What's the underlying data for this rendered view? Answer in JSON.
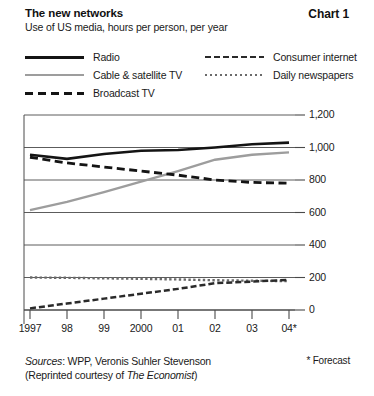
{
  "header": {
    "title": "The new networks",
    "subtitle": "Use of US media, hours per person, per year",
    "chart_number": "Chart 1"
  },
  "footer": {
    "sources_prefix": "Sources",
    "sources_text": ": WPP, Veronis Suhler Stevenson",
    "reprint_pre": "(Reprinted courtesy of ",
    "reprint_em": "The Economist",
    "reprint_post": ")",
    "forecast_note": "* Forecast"
  },
  "colors": {
    "radio": "#141414",
    "cable": "#9d9d9d",
    "broadcast": "#141414",
    "internet": "#2a2a2a",
    "newspapers": "#6a6a6a",
    "axis": "#4a4a4a",
    "grid": "#4a4a4a",
    "background": "#ffffff",
    "text": "#1a1a1a"
  },
  "chart_data": {
    "type": "line",
    "title": "The new networks",
    "subtitle": "Use of US media, hours per person, per year",
    "xlabel": "",
    "ylabel": "hours per person, per year",
    "x": [
      "1997",
      "98",
      "99",
      "2000",
      "01",
      "02",
      "03",
      "04*"
    ],
    "categories": [
      "1997",
      "98",
      "99",
      "2000",
      "01",
      "02",
      "03",
      "04*"
    ],
    "ylim": [
      0,
      1200
    ],
    "yticks": [
      0,
      200,
      400,
      600,
      800,
      1000,
      1200
    ],
    "ytick_labels": [
      "0",
      "200",
      "400",
      "600",
      "800",
      "1,000",
      "1,200"
    ],
    "y_axis_position": "right",
    "grid": true,
    "legend_position": "top",
    "series": [
      {
        "name": "Radio",
        "style": "solid-bold",
        "color": "#141414",
        "values": [
          955,
          930,
          960,
          980,
          985,
          1000,
          1020,
          1030
        ]
      },
      {
        "name": "Cable & satellite TV",
        "style": "solid-gray",
        "color": "#9d9d9d",
        "values": [
          615,
          665,
          725,
          790,
          855,
          925,
          955,
          970
        ]
      },
      {
        "name": "Broadcast TV",
        "style": "dash-bold",
        "color": "#141414",
        "values": [
          940,
          905,
          880,
          855,
          830,
          800,
          785,
          780
        ]
      },
      {
        "name": "Consumer internet",
        "style": "dash-medium",
        "color": "#2a2a2a",
        "values": [
          10,
          40,
          70,
          100,
          130,
          165,
          175,
          185
        ]
      },
      {
        "name": "Daily newspapers",
        "style": "dotted",
        "color": "#6a6a6a",
        "values": [
          200,
          198,
          195,
          192,
          188,
          183,
          180,
          178
        ]
      }
    ],
    "annotations": [
      "* Forecast"
    ]
  },
  "legend": {
    "left_column": [
      {
        "label": "Radio",
        "swatch": "line-solid-bold-icon"
      },
      {
        "label": "Cable & satellite TV",
        "swatch": "line-solid-gray-icon"
      },
      {
        "label": "Broadcast TV",
        "swatch": "line-dashed-bold-icon"
      }
    ],
    "right_column": [
      {
        "label": "Consumer internet",
        "swatch": "line-dashed-medium-icon"
      },
      {
        "label": "Daily newspapers",
        "swatch": "line-dotted-icon"
      }
    ]
  }
}
